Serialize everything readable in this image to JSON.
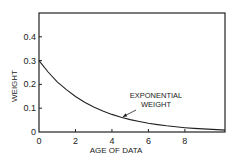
{
  "chart_data": {
    "type": "line",
    "title": "",
    "xlabel": "AGE OF DATA",
    "ylabel": "WEIGHT",
    "xlim": [
      0,
      10.2
    ],
    "ylim": [
      0,
      0.5
    ],
    "xticks": [
      0,
      2,
      4,
      6,
      8
    ],
    "xtick_labels": [
      "0",
      "2",
      "4",
      "6",
      "8"
    ],
    "yticks": [
      0,
      0.1,
      0.2,
      0.3,
      0.4
    ],
    "ytick_labels": [
      "0",
      "0.1",
      "0.2",
      "0.3",
      "0.4"
    ],
    "grid": false,
    "legend": null,
    "series": [
      {
        "name": "EXPONENTIAL WEIGHT",
        "x": [
          0,
          0.5,
          1,
          1.5,
          2,
          2.5,
          3,
          3.5,
          4,
          4.5,
          5,
          5.5,
          6,
          6.5,
          7,
          7.5,
          8,
          8.5,
          9,
          9.5,
          10,
          10.2
        ],
        "y": [
          0.3,
          0.252,
          0.211,
          0.178,
          0.149,
          0.125,
          0.105,
          0.088,
          0.074,
          0.062,
          0.052,
          0.044,
          0.037,
          0.031,
          0.026,
          0.022,
          0.018,
          0.015,
          0.013,
          0.011,
          0.009,
          0.008
        ]
      }
    ],
    "annotations": [
      {
        "text_lines": [
          "EXPONENTIAL",
          "WEIGHT"
        ],
        "points_to": {
          "x": 4.6,
          "y": 0.064
        }
      }
    ]
  }
}
